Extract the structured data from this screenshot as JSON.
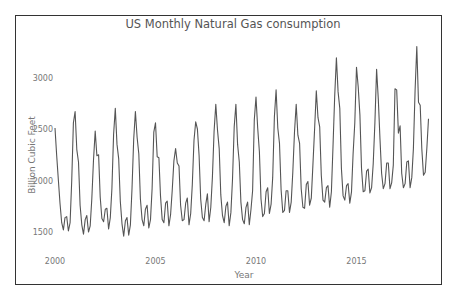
{
  "chart_data": {
    "type": "line",
    "title": "US Monthly Natural Gas consumption",
    "xlabel": "Year",
    "ylabel": "Billion Cubic Feet",
    "x_ticks": [
      2000,
      2005,
      2010,
      2015
    ],
    "y_ticks": [
      1500,
      2000,
      2500,
      3000
    ],
    "xlim": [
      2000,
      2018.6
    ],
    "ylim": [
      1340,
      3420
    ],
    "grid": false,
    "legend": null,
    "line_color": "#555555",
    "start": "2000-01",
    "frequency": "monthly",
    "series": [
      {
        "name": "Natural Gas consumption",
        "values": [
          2510,
          2240,
          2000,
          1780,
          1590,
          1520,
          1640,
          1650,
          1510,
          1590,
          1990,
          2560,
          2670,
          2300,
          2180,
          1760,
          1570,
          1480,
          1620,
          1660,
          1500,
          1560,
          1820,
          2200,
          2480,
          2240,
          2250,
          1840,
          1630,
          1600,
          1720,
          1730,
          1530,
          1640,
          1920,
          2450,
          2700,
          2350,
          2210,
          1800,
          1580,
          1460,
          1610,
          1640,
          1470,
          1570,
          1920,
          2400,
          2670,
          2420,
          2260,
          1820,
          1620,
          1560,
          1720,
          1760,
          1540,
          1620,
          1920,
          2470,
          2560,
          2230,
          2220,
          1850,
          1620,
          1590,
          1780,
          1800,
          1560,
          1670,
          1900,
          2190,
          2310,
          2170,
          2140,
          1760,
          1610,
          1620,
          1780,
          1830,
          1570,
          1680,
          1960,
          2390,
          2570,
          2500,
          2240,
          1820,
          1640,
          1610,
          1770,
          1870,
          1600,
          1740,
          2030,
          2480,
          2740,
          2490,
          2310,
          1860,
          1660,
          1590,
          1750,
          1790,
          1560,
          1690,
          2010,
          2520,
          2740,
          2350,
          2180,
          1790,
          1620,
          1580,
          1740,
          1790,
          1570,
          1720,
          1900,
          2590,
          2810,
          2510,
          2280,
          1820,
          1650,
          1680,
          1890,
          1930,
          1680,
          1770,
          2030,
          2620,
          2880,
          2510,
          2360,
          1910,
          1690,
          1710,
          1900,
          1900,
          1690,
          1790,
          2080,
          2470,
          2740,
          2440,
          2360,
          1920,
          1740,
          1730,
          1960,
          1990,
          1760,
          1830,
          2150,
          2500,
          2870,
          2610,
          2520,
          2050,
          1810,
          1790,
          1930,
          1950,
          1740,
          1890,
          2330,
          2820,
          3190,
          2860,
          2700,
          2120,
          1850,
          1810,
          1950,
          1970,
          1780,
          1890,
          2260,
          2560,
          3100,
          2910,
          2640,
          2120,
          1890,
          1900,
          2090,
          2110,
          1880,
          1930,
          2160,
          2560,
          3080,
          2790,
          2400,
          2070,
          1920,
          1970,
          2170,
          2170,
          1920,
          1980,
          2150,
          2890,
          2880,
          2460,
          2530,
          2070,
          1930,
          1970,
          2180,
          2190,
          1930,
          2030,
          2310,
          2880,
          3300,
          2760,
          2730,
          2310,
          2050,
          2080,
          2320,
          2600
        ]
      }
    ]
  },
  "colors": {
    "line": "#555555",
    "frame": "#333333",
    "text": "#777777",
    "title": "#555555"
  }
}
